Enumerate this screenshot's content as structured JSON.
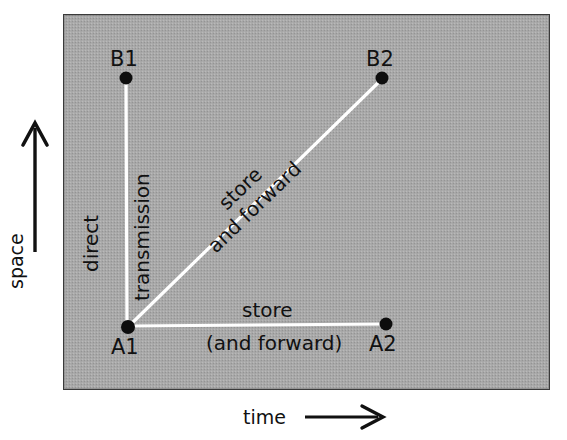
{
  "figure": {
    "type": "space-time-diagram",
    "title": "",
    "background_color": "#a9a9a9",
    "line_color": "#ffffff",
    "ink_color": "#111111",
    "axes": {
      "x": {
        "label": "time",
        "arrow": "right-arrow-icon"
      },
      "y": {
        "label": "space",
        "arrow": "up-arrow-icon"
      }
    },
    "nodes": [
      {
        "id": "B1",
        "label": "B1",
        "x": 126,
        "y": 78,
        "label_pos": "above"
      },
      {
        "id": "B2",
        "label": "B2",
        "x": 382,
        "y": 78,
        "label_pos": "above"
      },
      {
        "id": "A1",
        "label": "A1",
        "x": 128,
        "y": 327,
        "label_pos": "below"
      },
      {
        "id": "A2",
        "label": "A2",
        "x": 386,
        "y": 324,
        "label_pos": "below"
      }
    ],
    "edges": [
      {
        "id": "a1-b1",
        "from": "A1",
        "to": "B1",
        "orientation": "vertical",
        "labels": [
          {
            "text": "direct",
            "side": "left",
            "rotation": -90
          },
          {
            "text": "transmission",
            "side": "right",
            "rotation": -90
          }
        ]
      },
      {
        "id": "a1-b2",
        "from": "A1",
        "to": "B2",
        "orientation": "diagonal",
        "labels": [
          {
            "text": "store",
            "side": "above",
            "rotation": -44
          },
          {
            "text": "and forward",
            "side": "below",
            "rotation": -44
          }
        ]
      },
      {
        "id": "a1-a2",
        "from": "A1",
        "to": "A2",
        "orientation": "horizontal",
        "labels": [
          {
            "text": "store",
            "side": "above",
            "rotation": 0
          },
          {
            "text": "(and forward)",
            "side": "below",
            "rotation": 0
          }
        ]
      }
    ]
  }
}
